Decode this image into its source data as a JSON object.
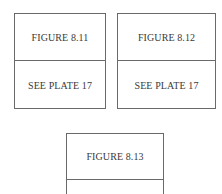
{
  "figures": [
    {
      "title": "FIGURE 8.11",
      "note": "SEE PLATE 17"
    },
    {
      "title": "FIGURE 8.12",
      "note": "SEE PLATE 17"
    },
    {
      "title": "FIGURE 8.13",
      "note": ""
    }
  ]
}
